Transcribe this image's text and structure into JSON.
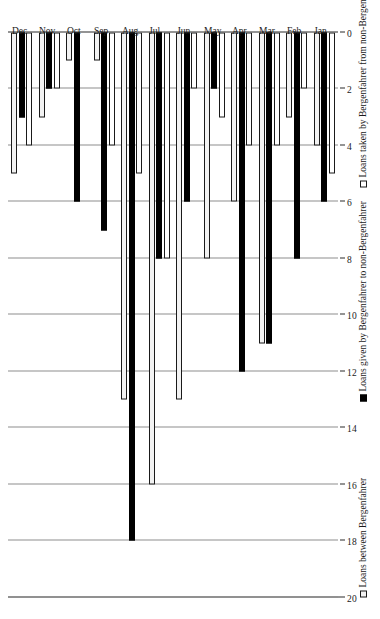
{
  "chart_data": {
    "type": "bar",
    "orientation": "horizontal",
    "title": "",
    "subtitle": "",
    "xlabel": "",
    "ylabel": "",
    "categories": [
      "Jan",
      "Feb",
      "Mar",
      "Apr",
      "May",
      "Jun",
      "Jul",
      "Aug",
      "Sep",
      "Oct",
      "Nov",
      "Dec"
    ],
    "series": [
      {
        "name": "Loans between Bergenfahrer",
        "style": "hollow-light",
        "values": [
          4,
          3,
          11,
          6,
          8,
          13,
          16,
          13,
          1,
          1,
          3,
          5
        ]
      },
      {
        "name": "Loans given by Bergenfahrer to non-Bergenfahrer",
        "style": "solid-black",
        "values": [
          6,
          8,
          11,
          12,
          2,
          6,
          8,
          18,
          7,
          6,
          2,
          3
        ]
      },
      {
        "name": "Loans taken by Bergenfahrer from non-Bergenfahrer",
        "style": "hollow-white",
        "values": [
          5,
          2,
          4,
          4,
          3,
          2,
          8,
          5,
          4,
          0,
          2,
          4
        ]
      }
    ],
    "xlim": [
      0,
      20
    ],
    "ticks": [
      20,
      18,
      16,
      14,
      12,
      10,
      8,
      6,
      4,
      2,
      0
    ],
    "grid": true,
    "legend_position": "right",
    "colors": {
      "between_fill": "#f2f2f2",
      "given_fill": "#000000",
      "taken_fill": "#ffffff",
      "stroke": "#1a1a1a",
      "gridline": "#8e8e8e",
      "background": "#ffffff"
    }
  },
  "legend": {
    "items": [
      {
        "label": "Loans between Bergenfahrer",
        "swatch": "hollow-light-swatch"
      },
      {
        "label": "Loans given by Bergenfahrer to non-Bergenfahrer",
        "swatch": "solid-black-swatch"
      },
      {
        "label": "Loans taken by Bergenfahrer from non-Bergenfahrer",
        "swatch": "hollow-white-swatch"
      }
    ]
  }
}
